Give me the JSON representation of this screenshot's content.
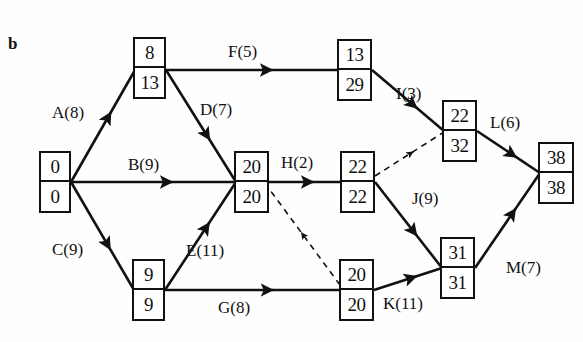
{
  "figure": {
    "panel_label": "b",
    "type": "activity-on-arrow-network-diagram",
    "colors": {
      "stroke": "#111111",
      "background": "#fefefe"
    }
  },
  "nodes": [
    {
      "id": "n-start",
      "name": "node-start",
      "top": "0",
      "bottom": "0",
      "x": 39,
      "y": 151,
      "w": 32,
      "h": 62
    },
    {
      "id": "n-a",
      "name": "node-a-8-13",
      "top": "8",
      "bottom": "13",
      "x": 133,
      "y": 37,
      "w": 33,
      "h": 62
    },
    {
      "id": "n-c",
      "name": "node-c-9-9",
      "top": "9",
      "bottom": "9",
      "x": 132,
      "y": 259,
      "w": 33,
      "h": 62
    },
    {
      "id": "n-bd",
      "name": "node-bd-20-20",
      "top": "20",
      "bottom": "20",
      "x": 234,
      "y": 151,
      "w": 35,
      "h": 62
    },
    {
      "id": "n-f",
      "name": "node-f-13-29",
      "top": "13",
      "bottom": "29",
      "x": 337,
      "y": 39,
      "w": 35,
      "h": 62
    },
    {
      "id": "n-h",
      "name": "node-h-22-22",
      "top": "22",
      "bottom": "22",
      "x": 340,
      "y": 151,
      "w": 35,
      "h": 62
    },
    {
      "id": "n-g",
      "name": "node-g-20-20",
      "top": "20",
      "bottom": "20",
      "x": 339,
      "y": 259,
      "w": 35,
      "h": 62
    },
    {
      "id": "n-i",
      "name": "node-i-22-32",
      "top": "22",
      "bottom": "32",
      "x": 442,
      "y": 100,
      "w": 35,
      "h": 62
    },
    {
      "id": "n-jk",
      "name": "node-jk-31-31",
      "top": "31",
      "bottom": "31",
      "x": 440,
      "y": 237,
      "w": 35,
      "h": 62
    },
    {
      "id": "n-end",
      "name": "node-end-38-38",
      "top": "38",
      "bottom": "38",
      "x": 538,
      "y": 142,
      "w": 36,
      "h": 62
    }
  ],
  "edges": [
    {
      "id": "e-a",
      "name": "edge-a",
      "label": "A(8)",
      "style": "solid",
      "label_x": 52,
      "label_y": 103,
      "x1": 71,
      "y1": 182,
      "x2": 135,
      "y2": 70
    },
    {
      "id": "e-b",
      "name": "edge-b",
      "label": "B(9)",
      "style": "solid",
      "label_x": 128,
      "label_y": 155,
      "x1": 71,
      "y1": 182,
      "x2": 234,
      "y2": 182
    },
    {
      "id": "e-c",
      "name": "edge-c",
      "label": "C(9)",
      "style": "solid",
      "label_x": 52,
      "label_y": 240,
      "x1": 71,
      "y1": 182,
      "x2": 134,
      "y2": 290
    },
    {
      "id": "e-d",
      "name": "edge-d",
      "label": "D(7)",
      "style": "solid",
      "label_x": 200,
      "label_y": 100,
      "x1": 166,
      "y1": 70,
      "x2": 236,
      "y2": 182
    },
    {
      "id": "e-e",
      "name": "edge-e",
      "label": "E(11)",
      "style": "solid",
      "label_x": 186,
      "label_y": 241,
      "x1": 165,
      "y1": 290,
      "x2": 236,
      "y2": 182
    },
    {
      "id": "e-f",
      "name": "edge-f",
      "label": "F(5)",
      "style": "solid",
      "label_x": 228,
      "label_y": 42,
      "x1": 166,
      "y1": 70,
      "x2": 337,
      "y2": 70
    },
    {
      "id": "e-g",
      "name": "edge-g",
      "label": "G(8)",
      "style": "solid",
      "label_x": 218,
      "label_y": 298,
      "x1": 165,
      "y1": 290,
      "x2": 339,
      "y2": 290
    },
    {
      "id": "e-h",
      "name": "edge-h",
      "label": "H(2)",
      "style": "solid",
      "label_x": 281,
      "label_y": 153,
      "x1": 269,
      "y1": 182,
      "x2": 340,
      "y2": 182
    },
    {
      "id": "e-i",
      "name": "edge-i",
      "label": "I(3)",
      "style": "solid",
      "label_x": 396,
      "label_y": 84,
      "x1": 372,
      "y1": 70,
      "x2": 444,
      "y2": 131
    },
    {
      "id": "e-j",
      "name": "edge-j",
      "label": "J(9)",
      "style": "solid",
      "label_x": 412,
      "label_y": 189,
      "x1": 375,
      "y1": 182,
      "x2": 442,
      "y2": 268
    },
    {
      "id": "e-k",
      "name": "edge-k",
      "label": "K(11)",
      "style": "solid",
      "label_x": 383,
      "label_y": 294,
      "x1": 374,
      "y1": 290,
      "x2": 442,
      "y2": 268
    },
    {
      "id": "e-l",
      "name": "edge-l",
      "label": "L(6)",
      "style": "solid",
      "label_x": 490,
      "label_y": 113,
      "x1": 477,
      "y1": 131,
      "x2": 540,
      "y2": 173
    },
    {
      "id": "e-m",
      "name": "edge-m",
      "label": "M(7)",
      "style": "solid",
      "label_x": 506,
      "label_y": 258,
      "x1": 475,
      "y1": 268,
      "x2": 540,
      "y2": 173
    },
    {
      "id": "e-dummy-1",
      "name": "edge-dummy-upper",
      "label": "",
      "style": "dashed",
      "label_x": 0,
      "label_y": 0,
      "x1": 375,
      "y1": 176,
      "x2": 444,
      "y2": 132
    },
    {
      "id": "e-dummy-2",
      "name": "edge-dummy-lower",
      "label": "",
      "style": "dashed",
      "label_x": 0,
      "label_y": 0,
      "x1": 340,
      "y1": 285,
      "x2": 270,
      "y2": 190
    }
  ],
  "chart_data": {
    "type": "diagram",
    "title": "b",
    "node_values": [
      {
        "node": "start",
        "earliest": 0,
        "latest": 0
      },
      {
        "node": "a-end",
        "earliest": 8,
        "latest": 13
      },
      {
        "node": "c-end",
        "earliest": 9,
        "latest": 9
      },
      {
        "node": "bd-end",
        "earliest": 20,
        "latest": 20
      },
      {
        "node": "f-end",
        "earliest": 13,
        "latest": 29
      },
      {
        "node": "h-end",
        "earliest": 22,
        "latest": 22
      },
      {
        "node": "g-end",
        "earliest": 20,
        "latest": 20
      },
      {
        "node": "i-end",
        "earliest": 22,
        "latest": 32
      },
      {
        "node": "jk-end",
        "earliest": 31,
        "latest": 31
      },
      {
        "node": "finish",
        "earliest": 38,
        "latest": 38
      }
    ],
    "activities": [
      {
        "name": "A",
        "duration": 8
      },
      {
        "name": "B",
        "duration": 9
      },
      {
        "name": "C",
        "duration": 9
      },
      {
        "name": "D",
        "duration": 7
      },
      {
        "name": "E",
        "duration": 11
      },
      {
        "name": "F",
        "duration": 5
      },
      {
        "name": "G",
        "duration": 8
      },
      {
        "name": "H",
        "duration": 2
      },
      {
        "name": "I",
        "duration": 3
      },
      {
        "name": "J",
        "duration": 9
      },
      {
        "name": "K",
        "duration": 11
      },
      {
        "name": "L",
        "duration": 6
      },
      {
        "name": "M",
        "duration": 7
      }
    ]
  }
}
